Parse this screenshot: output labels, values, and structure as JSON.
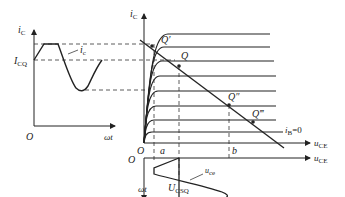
{
  "diagram": {
    "left_plot": {
      "y_axis_label": "i",
      "y_axis_sub": "C",
      "x_axis_label": "ωt",
      "origin_label": "O",
      "icq_label": "I",
      "icq_sub": "CQ",
      "curve_label": "i",
      "curve_sub": "c"
    },
    "right_plot": {
      "y_axis_label": "i",
      "y_axis_sub": "C",
      "x_axis_label": "u",
      "x_axis_sub": "CE",
      "origin_label": "O",
      "points": [
        "Q′",
        "Q",
        "Q″",
        "Q‴"
      ],
      "ib_zero_label": "i",
      "ib_zero_sub": "B",
      "ib_zero_value": "=0",
      "tick_a": "a",
      "tick_b": "b"
    },
    "bottom_plot": {
      "origin_label": "O",
      "x_axis_label": "u",
      "x_axis_sub": "CE",
      "y_axis_label": "ωt",
      "ucsq_label": "U",
      "ucsq_sub": "CSQ",
      "curve_label": "u",
      "curve_sub": "ce"
    }
  }
}
